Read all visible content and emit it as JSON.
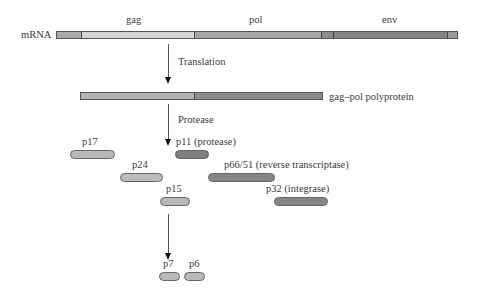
{
  "colors": {
    "light": "#d4d4d4",
    "medium": "#a9a9a9",
    "dark": "#8a8a8a",
    "darkest": "#7a7a7a"
  },
  "mrna": {
    "label": "mRNA",
    "genes": [
      {
        "name": "gag"
      },
      {
        "name": "pol"
      },
      {
        "name": "env"
      }
    ]
  },
  "steps": {
    "translation": "Translation",
    "protease": "Protease"
  },
  "polyprotein": {
    "label": "gag–pol polyprotein"
  },
  "proteins": [
    {
      "id": "p17",
      "label": "p17"
    },
    {
      "id": "p24",
      "label": "p24"
    },
    {
      "id": "p15",
      "label": "p15"
    },
    {
      "id": "p11",
      "label": "p11 (protease)"
    },
    {
      "id": "p66-51",
      "label": "p66/51 (reverse transcriptase)"
    },
    {
      "id": "p32",
      "label": "p32 (integrase)"
    },
    {
      "id": "p7",
      "label": "p7"
    },
    {
      "id": "p6",
      "label": "p6"
    }
  ]
}
